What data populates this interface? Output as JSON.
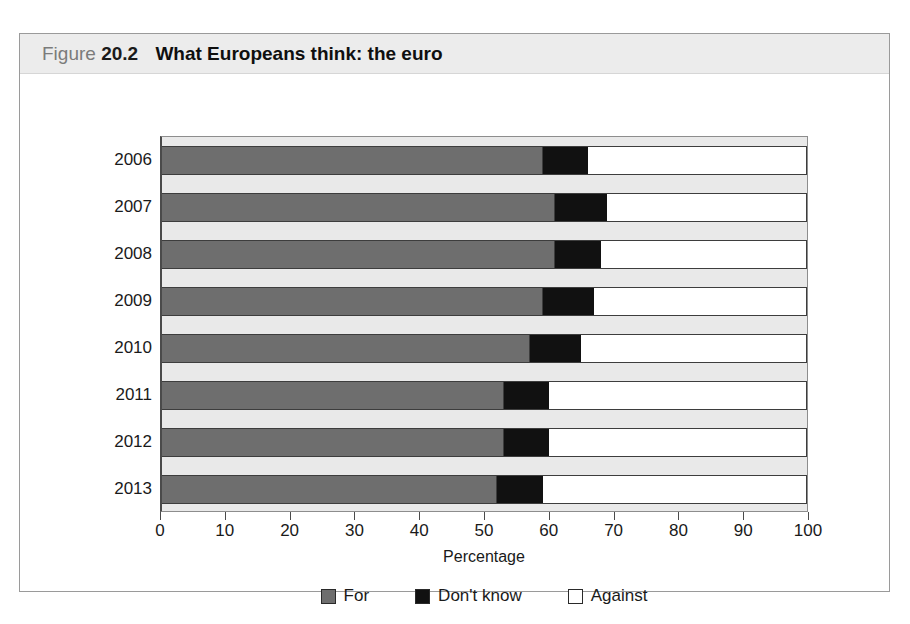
{
  "figure": {
    "label": "Figure",
    "number": "20.2",
    "title": "What Europeans think: the euro"
  },
  "chart_data": {
    "type": "bar",
    "orientation": "horizontal",
    "stacked": true,
    "stack_mode": "percent",
    "title": "What Europeans think: the euro",
    "xlabel": "Percentage",
    "ylabel": "",
    "xlim": [
      0,
      100
    ],
    "xticks": [
      0,
      10,
      20,
      30,
      40,
      50,
      60,
      70,
      80,
      90,
      100
    ],
    "xtick_labels": [
      "0",
      "10",
      "20",
      "30",
      "40",
      "50",
      "60",
      "70",
      "80",
      "90",
      "100"
    ],
    "grid": false,
    "legend_position": "bottom",
    "categories": [
      "2006",
      "2007",
      "2008",
      "2009",
      "2010",
      "2011",
      "2012",
      "2013"
    ],
    "series": [
      {
        "name": "For",
        "color": "#6e6e6e",
        "values": [
          59,
          61,
          61,
          59,
          57,
          53,
          53,
          52
        ]
      },
      {
        "name": "Don't know",
        "color": "#111111",
        "values": [
          7,
          8,
          7,
          8,
          8,
          7,
          7,
          7
        ]
      },
      {
        "name": "Against",
        "color": "#ffffff",
        "values": [
          34,
          31,
          32,
          33,
          35,
          40,
          40,
          41
        ]
      }
    ]
  },
  "legend": {
    "items": [
      {
        "label": "For",
        "color": "#6e6e6e"
      },
      {
        "label": "Don't know",
        "color": "#111111"
      },
      {
        "label": "Against",
        "color": "#ffffff"
      }
    ]
  },
  "colors": {
    "header_band": "#ececec",
    "plot_background": "#e9e9e9",
    "frame": "#9a9a9a",
    "axis": "#4a4a4a"
  }
}
